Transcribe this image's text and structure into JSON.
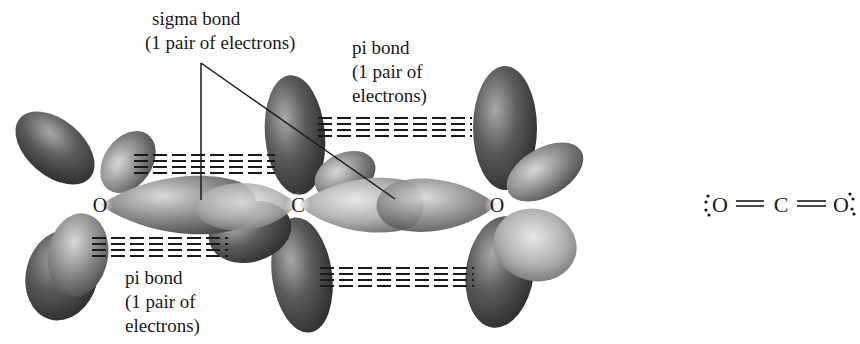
{
  "diagram": {
    "atoms": [
      {
        "symbol": "O",
        "position": "left"
      },
      {
        "symbol": "C",
        "position": "center"
      },
      {
        "symbol": "O",
        "position": "right"
      }
    ],
    "labels": {
      "sigma": {
        "line1": "sigma bond",
        "line2": "(1 pair of electrons)"
      },
      "pi_top": {
        "line1": "pi bond",
        "line2": "(1 pair of",
        "line3": "electrons)"
      },
      "pi_bottom": {
        "line1": "pi bond",
        "line2": "(1 pair of",
        "line3": "electrons)"
      }
    },
    "lewis_structure": {
      "left_atom": "O",
      "center_atom": "C",
      "right_atom": "O",
      "bond": "double",
      "lone_pairs_per_oxygen": 2
    },
    "colors": {
      "lobe_dark": "#3a3a3a",
      "lobe_light": "#bdbdbd",
      "text": "#1a1a1a",
      "background": "#ffffff"
    }
  }
}
